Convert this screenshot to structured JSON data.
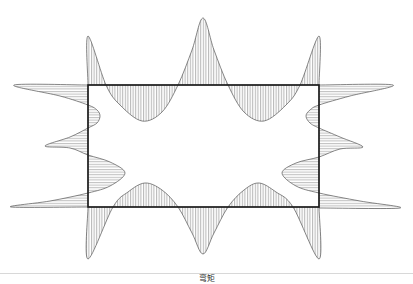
{
  "caption": "弯矩",
  "diagram": {
    "type": "bending-moment-diagram",
    "colors": {
      "frame": "#1a1a1a",
      "curve": "#555555",
      "hatch": "#777777",
      "separator": "#d8d8d8"
    },
    "frame": {
      "left": 88,
      "top": 85,
      "right": 319,
      "bottom": 207
    },
    "top_beam": [
      [
        88,
        85
      ],
      [
        88,
        36
      ],
      [
        106,
        85
      ],
      [
        120,
        105
      ],
      [
        142,
        121
      ],
      [
        162,
        112
      ],
      [
        178,
        85
      ],
      [
        192,
        50
      ],
      [
        203,
        18
      ],
      [
        214,
        50
      ],
      [
        228,
        85
      ],
      [
        244,
        112
      ],
      [
        264,
        121
      ],
      [
        286,
        105
      ],
      [
        300,
        85
      ],
      [
        319,
        36
      ],
      [
        319,
        85
      ]
    ],
    "bottom_beam": [
      [
        88,
        207
      ],
      [
        88,
        259
      ],
      [
        113,
        207
      ],
      [
        128,
        192
      ],
      [
        145,
        183
      ],
      [
        162,
        190
      ],
      [
        178,
        207
      ],
      [
        192,
        233
      ],
      [
        203,
        254
      ],
      [
        214,
        233
      ],
      [
        228,
        207
      ],
      [
        244,
        190
      ],
      [
        259,
        183
      ],
      [
        276,
        192
      ],
      [
        293,
        207
      ],
      [
        319,
        259
      ],
      [
        319,
        207
      ]
    ],
    "left_column": [
      [
        88,
        85
      ],
      [
        14,
        85
      ],
      [
        60,
        96
      ],
      [
        88,
        105
      ],
      [
        97,
        110
      ],
      [
        100,
        116
      ],
      [
        97,
        123
      ],
      [
        88,
        128
      ],
      [
        70,
        137
      ],
      [
        45,
        146
      ],
      [
        70,
        148
      ],
      [
        88,
        155
      ],
      [
        110,
        162
      ],
      [
        125,
        173
      ],
      [
        110,
        186
      ],
      [
        88,
        193
      ],
      [
        50,
        201
      ],
      [
        11,
        207
      ],
      [
        88,
        207
      ]
    ],
    "right_column": [
      [
        319,
        85
      ],
      [
        393,
        85
      ],
      [
        350,
        96
      ],
      [
        319,
        105
      ],
      [
        310,
        110
      ],
      [
        306,
        116
      ],
      [
        310,
        123
      ],
      [
        319,
        128
      ],
      [
        340,
        137
      ],
      [
        363,
        147
      ],
      [
        340,
        149
      ],
      [
        319,
        157
      ],
      [
        296,
        163
      ],
      [
        282,
        173
      ],
      [
        296,
        186
      ],
      [
        319,
        193
      ],
      [
        360,
        201
      ],
      [
        400,
        208
      ],
      [
        319,
        208
      ]
    ]
  }
}
